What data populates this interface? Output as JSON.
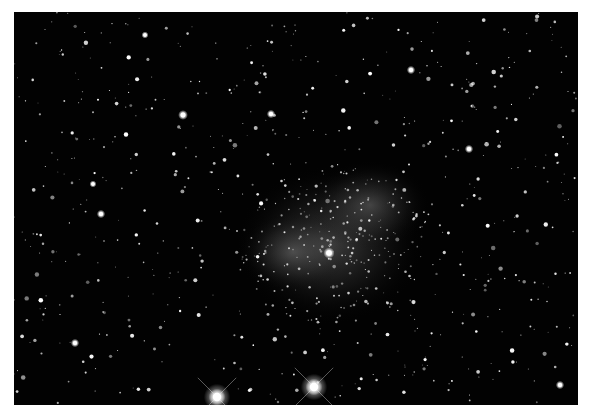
{
  "image": {
    "subject": "star field with faint irregular galaxy",
    "background_color": "#020202",
    "border_color": "#ffffff",
    "field": {
      "x": 14,
      "y": 12,
      "width": 564,
      "height": 393
    }
  },
  "galaxy": {
    "center": [
      330,
      245
    ],
    "rx": 95,
    "ry": 80,
    "core": [
      318,
      262
    ],
    "glow_color": "#9a9a9a"
  },
  "bright_stars": [
    {
      "x": 217,
      "y": 397,
      "r": 6,
      "spikes": true
    },
    {
      "x": 314,
      "y": 387,
      "r": 6,
      "spikes": true
    },
    {
      "x": 329,
      "y": 253,
      "r": 4,
      "spikes": false
    },
    {
      "x": 183,
      "y": 115,
      "r": 3.5,
      "spikes": false
    },
    {
      "x": 271,
      "y": 114,
      "r": 3,
      "spikes": false
    },
    {
      "x": 101,
      "y": 214,
      "r": 3,
      "spikes": false
    },
    {
      "x": 75,
      "y": 343,
      "r": 3,
      "spikes": false
    },
    {
      "x": 469,
      "y": 149,
      "r": 3,
      "spikes": false
    },
    {
      "x": 411,
      "y": 70,
      "r": 3,
      "spikes": false
    },
    {
      "x": 560,
      "y": 385,
      "r": 3,
      "spikes": false
    },
    {
      "x": 145,
      "y": 35,
      "r": 2.5,
      "spikes": false
    },
    {
      "x": 93,
      "y": 184,
      "r": 2.5,
      "spikes": false
    }
  ],
  "star_field": {
    "seed": 7,
    "count": 650
  }
}
